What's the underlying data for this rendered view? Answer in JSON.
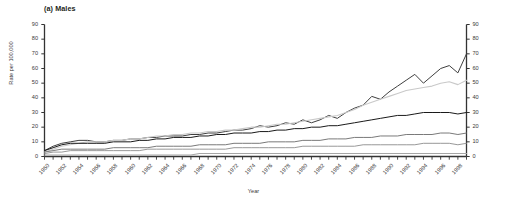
{
  "figure": {
    "panel_title": "(a) Males",
    "background_color": "#ffffff"
  },
  "chart_data": {
    "type": "line",
    "title": "(a) Males",
    "xlabel": "Year",
    "ylabel": "Rate per 100,000",
    "xlim": [
      1950,
      1999
    ],
    "ylim": [
      0,
      90
    ],
    "grid": false,
    "legend": "none",
    "dual_y_axis": true,
    "y_ticks": [
      0,
      10,
      20,
      30,
      40,
      50,
      60,
      70,
      80,
      90
    ],
    "y_ticks_right": [
      0,
      10,
      20,
      30,
      40,
      50,
      60,
      70,
      80,
      90
    ],
    "x_ticks": [
      1950,
      1952,
      1954,
      1956,
      1958,
      1960,
      1962,
      1964,
      1966,
      1968,
      1970,
      1972,
      1974,
      1976,
      1978,
      1980,
      1982,
      1984,
      1986,
      1988,
      1990,
      1992,
      1994,
      1996,
      1998
    ],
    "x": [
      1950,
      1951,
      1952,
      1953,
      1954,
      1955,
      1956,
      1957,
      1958,
      1959,
      1960,
      1961,
      1962,
      1963,
      1964,
      1965,
      1966,
      1967,
      1968,
      1969,
      1970,
      1971,
      1972,
      1973,
      1974,
      1975,
      1976,
      1977,
      1978,
      1979,
      1980,
      1981,
      1982,
      1983,
      1984,
      1985,
      1986,
      1987,
      1988,
      1989,
      1990,
      1991,
      1992,
      1993,
      1994,
      1995,
      1996,
      1997,
      1998,
      1999
    ],
    "series": [
      {
        "name": "series-1",
        "color": "#3f3f3f",
        "width": 1.0,
        "values": [
          4,
          7,
          9,
          10,
          11,
          11,
          10,
          10,
          11,
          11,
          12,
          12,
          13,
          13,
          14,
          14,
          14,
          15,
          15,
          16,
          16,
          17,
          18,
          18,
          19,
          21,
          20,
          21,
          23,
          22,
          25,
          23,
          25,
          28,
          26,
          30,
          33,
          35,
          41,
          39,
          44,
          48,
          52,
          56,
          50,
          55,
          60,
          62,
          57,
          70
        ]
      },
      {
        "name": "series-2",
        "color": "#c9c9c9",
        "width": 1.1,
        "values": [
          3,
          5,
          7,
          8,
          9,
          10,
          10,
          10,
          11,
          11,
          12,
          12,
          13,
          14,
          14,
          15,
          15,
          16,
          16,
          17,
          17,
          18,
          18,
          19,
          20,
          20,
          21,
          22,
          22,
          23,
          24,
          25,
          26,
          27,
          28,
          30,
          32,
          35,
          37,
          39,
          41,
          43,
          45,
          46,
          47,
          48,
          50,
          51,
          49,
          52
        ]
      },
      {
        "name": "series-3",
        "color": "#1a1a1a",
        "width": 1.0,
        "values": [
          4,
          6,
          8,
          9,
          9,
          9,
          9,
          9,
          10,
          10,
          10,
          11,
          11,
          12,
          12,
          13,
          13,
          13,
          14,
          14,
          15,
          15,
          16,
          16,
          16,
          17,
          17,
          18,
          18,
          19,
          19,
          20,
          20,
          21,
          21,
          22,
          23,
          24,
          25,
          26,
          27,
          28,
          28,
          29,
          30,
          30,
          30,
          30,
          29,
          30
        ]
      },
      {
        "name": "series-4",
        "color": "#6b6b6b",
        "width": 0.9,
        "values": [
          3,
          4,
          5,
          5,
          5,
          5,
          5,
          5,
          6,
          6,
          6,
          6,
          6,
          7,
          7,
          7,
          7,
          7,
          8,
          8,
          8,
          8,
          9,
          9,
          9,
          9,
          10,
          10,
          10,
          10,
          11,
          11,
          11,
          12,
          12,
          12,
          13,
          13,
          13,
          14,
          14,
          14,
          15,
          15,
          15,
          15,
          16,
          16,
          15,
          16
        ]
      },
      {
        "name": "series-5",
        "color": "#8c8c8c",
        "width": 0.9,
        "values": [
          2,
          3,
          3,
          4,
          4,
          4,
          4,
          4,
          4,
          4,
          4,
          4,
          5,
          5,
          5,
          5,
          5,
          5,
          5,
          5,
          5,
          5,
          6,
          6,
          6,
          6,
          6,
          6,
          6,
          6,
          7,
          7,
          7,
          7,
          7,
          7,
          7,
          8,
          8,
          8,
          8,
          8,
          8,
          8,
          9,
          9,
          9,
          9,
          8,
          9
        ]
      },
      {
        "name": "series-6",
        "color": "#a6a6a6",
        "width": 1.1,
        "values": [
          1,
          1,
          1,
          1,
          1,
          1,
          1,
          1,
          1,
          1,
          1,
          1,
          1,
          1,
          1,
          1,
          1,
          1,
          2,
          2,
          2,
          2,
          2,
          2,
          2,
          2,
          2,
          2,
          2,
          2,
          2,
          2,
          2,
          2,
          2,
          2,
          2,
          2,
          2,
          2,
          2,
          2,
          2,
          2,
          2,
          2,
          2,
          2,
          2,
          2
        ]
      }
    ]
  }
}
